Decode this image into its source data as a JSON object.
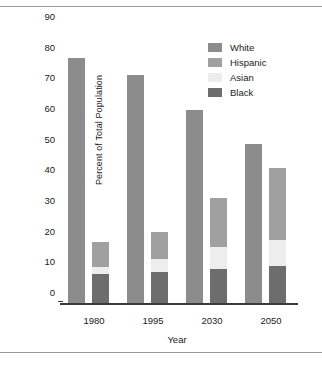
{
  "chart_data": {
    "type": "bar",
    "title": "",
    "subtitle": "",
    "xlabel": "Year",
    "ylabel": "Percent of Total Population",
    "categories": [
      "1980",
      "1995",
      "2030",
      "2050"
    ],
    "ylim": [
      0,
      90
    ],
    "yticks": [
      0,
      10,
      20,
      30,
      40,
      50,
      60,
      70,
      80,
      90
    ],
    "ytick_labels": [
      "0",
      "10",
      "20",
      "30",
      "40",
      "50",
      "60",
      "70",
      "80",
      "90"
    ],
    "grid": false,
    "legend_position": "top-right",
    "layout": "white series plotted as its own bar; Black, Asian and Hispanic stacked in a second bar per year",
    "series": [
      {
        "name": "White",
        "color": "#8c8c8c",
        "values": [
          79.8,
          74.5,
          62.8,
          52.0
        ]
      },
      {
        "name": "Hispanic",
        "color": "#a0a0a0",
        "values": [
          8.3,
          9.0,
          16.0,
          23.5
        ]
      },
      {
        "name": "Asian",
        "color": "#ededed",
        "values": [
          2.4,
          4.2,
          7.0,
          8.5
        ]
      },
      {
        "name": "Black",
        "color": "#6d6d6d",
        "values": [
          9.3,
          10.0,
          11.2,
          12.0
        ]
      }
    ],
    "stack_totals": [
      20.0,
      23.2,
      34.2,
      44.0
    ]
  },
  "legend": {
    "items": [
      {
        "label": "White",
        "color": "#8c8c8c"
      },
      {
        "label": "Hispanic",
        "color": "#a0a0a0"
      },
      {
        "label": "Asian",
        "color": "#ededed"
      },
      {
        "label": "Black",
        "color": "#6d6d6d"
      }
    ]
  },
  "colors": {
    "axis": "#3a3a3a",
    "frame_rule": "#9a9a9a",
    "text": "#1a1a1a",
    "background": "#ffffff"
  }
}
